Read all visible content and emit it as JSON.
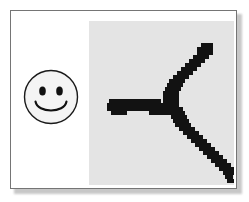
{
  "scene": {
    "title": "Framed card with smiley icon and pixelated stroke",
    "background_color": "#ffffff"
  },
  "card": {
    "name": "framed-card",
    "background_color": "#ffffff",
    "border_color": "#757575",
    "shadow_color": "#9a9a9a"
  },
  "smiley": {
    "name": "smiley-face",
    "label": "smiley face",
    "face_fill": "#f2f2f2",
    "outline_color": "#1a1a1a",
    "eye_color": "#111111",
    "mouth_color": "#111111",
    "eyes": 2,
    "expression": "smile"
  },
  "raster_panel": {
    "name": "pixelated-stroke-panel",
    "label": "pixelated stroke",
    "background_color": "#e4e4e4",
    "ink_color": "#121212",
    "description": "aliased handwritten branching stroke",
    "strokes": [
      {
        "name": "horizontal-branch",
        "orientation": "horizontal"
      },
      {
        "name": "upper-diagonal-branch",
        "orientation": "diagonal-up-right"
      },
      {
        "name": "lower-diagonal-branch",
        "orientation": "diagonal-down-right"
      }
    ],
    "grid": {
      "cell": 4,
      "cols": 36,
      "rows": 41,
      "ink_cells": [
        [
          2,
          44
        ],
        [
          3,
          44
        ],
        [
          4,
          44
        ],
        [
          5,
          44
        ],
        [
          6,
          44
        ],
        [
          7,
          44
        ],
        [
          8,
          44
        ],
        [
          9,
          44
        ],
        [
          10,
          44
        ],
        [
          11,
          44
        ],
        [
          12,
          44
        ],
        [
          13,
          44
        ],
        [
          14,
          44
        ],
        [
          15,
          44
        ],
        [
          2,
          48
        ],
        [
          3,
          48
        ],
        [
          4,
          48
        ],
        [
          5,
          48
        ],
        [
          6,
          48
        ],
        [
          7,
          48
        ],
        [
          8,
          48
        ],
        [
          9,
          48
        ],
        [
          10,
          48
        ],
        [
          11,
          48
        ],
        [
          12,
          48
        ],
        [
          13,
          48
        ],
        [
          14,
          48
        ],
        [
          15,
          48
        ],
        [
          2,
          52
        ],
        [
          3,
          52
        ],
        [
          4,
          52
        ],
        [
          5,
          52
        ],
        [
          6,
          52
        ],
        [
          7,
          52
        ],
        [
          8,
          52
        ],
        [
          9,
          52
        ],
        [
          10,
          52
        ],
        [
          11,
          52
        ],
        [
          12,
          52
        ],
        [
          13,
          52
        ],
        [
          14,
          52
        ],
        [
          15,
          52
        ]
      ]
    }
  }
}
